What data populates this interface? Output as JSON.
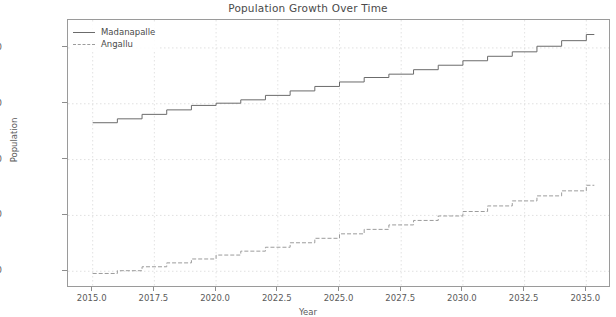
{
  "chart_data": {
    "type": "line",
    "title": "Population Growth Over Time",
    "xlabel": "Year",
    "ylabel": "Population",
    "xlim": [
      2014.0,
      2036.0
    ],
    "ylim": [
      35000,
      275000
    ],
    "xticks": [
      "2015.0",
      "2017.5",
      "2020.0",
      "2022.5",
      "2025.0",
      "2027.5",
      "2030.0",
      "2032.5",
      "2035.0"
    ],
    "xtick_values": [
      2015.0,
      2017.5,
      2020.0,
      2022.5,
      2025.0,
      2027.5,
      2030.0,
      2032.5,
      2035.0
    ],
    "yticks": [
      "50000",
      "100000",
      "150000",
      "200000",
      "250000"
    ],
    "ytick_values": [
      50000,
      100000,
      150000,
      200000,
      250000
    ],
    "grid": true,
    "drawstyle": "steps-post",
    "legend_position": "upper left",
    "x": [
      2015,
      2016,
      2017,
      2018,
      2019,
      2020,
      2021,
      2022,
      2023,
      2024,
      2025,
      2026,
      2027,
      2028,
      2029,
      2030,
      2031,
      2032,
      2033,
      2034,
      2035
    ],
    "series": [
      {
        "name": "Madanapalle",
        "color": "#6b6b6b",
        "linestyle": "solid",
        "values": [
          183000,
          186500,
          190500,
          194500,
          198500,
          200500,
          203500,
          207500,
          211500,
          215500,
          219500,
          223500,
          226500,
          230500,
          234500,
          238500,
          242500,
          246500,
          251500,
          256500,
          262000
        ]
      },
      {
        "name": "Angallu",
        "color": "#9c9c9c",
        "linestyle": "dashed",
        "values": [
          48000,
          50500,
          54000,
          57500,
          61000,
          64500,
          68000,
          71500,
          75500,
          79500,
          83500,
          87500,
          91500,
          95500,
          99500,
          103500,
          108500,
          113000,
          117500,
          122000,
          127000
        ]
      }
    ]
  },
  "legend": {
    "entries": [
      {
        "label": "Madanapalle"
      },
      {
        "label": "Angallu"
      }
    ]
  }
}
